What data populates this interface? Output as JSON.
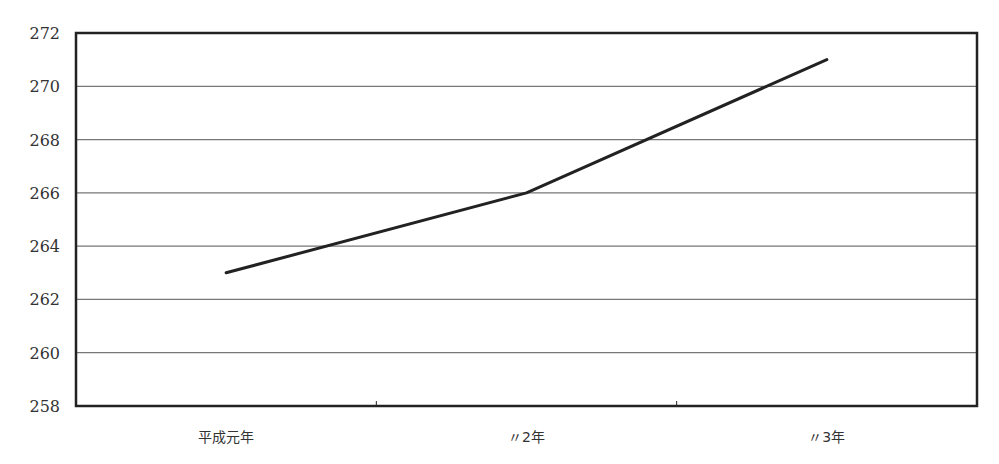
{
  "chart_data": {
    "type": "line",
    "title": "",
    "xlabel": "",
    "ylabel": "",
    "categories": [
      "平成元年",
      "〃2年",
      "〃3年"
    ],
    "series": [
      {
        "name": "",
        "values": [
          263,
          266,
          271
        ],
        "color": "#222222"
      }
    ],
    "ylim": [
      258,
      272
    ],
    "yticks": [
      258,
      260,
      262,
      264,
      266,
      268,
      270,
      272
    ],
    "grid": true,
    "legend": "none"
  },
  "colors": {
    "line": "#222222",
    "grid": "#777777",
    "frame": "#222222",
    "background": "#ffffff"
  }
}
